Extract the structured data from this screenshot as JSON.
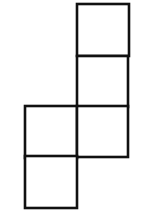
{
  "diagram": {
    "type": "net-of-squares",
    "stroke_color": "#111111",
    "fill_color": "#ffffff",
    "squares": [
      {
        "id": "sq-1",
        "col": 1,
        "row": 0,
        "x": 77,
        "y": 4,
        "size": 52
      },
      {
        "id": "sq-2",
        "col": 1,
        "row": 1,
        "x": 77,
        "y": 56,
        "size": 51
      },
      {
        "id": "sq-3",
        "col": 0,
        "row": 2,
        "x": 25,
        "y": 106,
        "size": 52
      },
      {
        "id": "sq-4",
        "col": 1,
        "row": 2,
        "x": 77,
        "y": 106,
        "size": 51
      },
      {
        "id": "sq-5",
        "col": 0,
        "row": 3,
        "x": 25,
        "y": 156,
        "size": 52
      }
    ]
  }
}
